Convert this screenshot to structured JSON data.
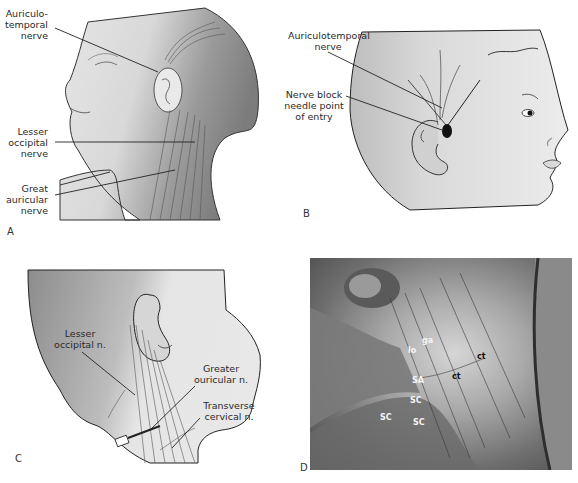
{
  "figure": {
    "panels": [
      {
        "id": "A",
        "letter": "A",
        "labels": {
          "auriculotemporal": [
            "Auriculo-",
            "temporal",
            "nerve"
          ],
          "lesser_occipital": [
            "Lesser",
            "occipital",
            "nerve"
          ],
          "great_auricular": [
            "Great",
            "auricular",
            "nerve"
          ]
        }
      },
      {
        "id": "B",
        "letter": "B",
        "labels": {
          "auriculotemporal": [
            "Auriculotemporal",
            "nerve"
          ],
          "needle_point": [
            "Nerve block",
            "needle point",
            "of entry"
          ]
        }
      },
      {
        "id": "C",
        "letter": "C",
        "labels": {
          "lesser_occipital": [
            "Lesser",
            "occipital n."
          ],
          "greater_auricular": [
            "Greater",
            "ouricular n."
          ],
          "transverse_cervical": [
            "Transverse",
            "cervical n."
          ]
        }
      },
      {
        "id": "D",
        "letter": "D",
        "labels": {
          "lo": "lo",
          "ga": "ga",
          "ct1": "ct",
          "ct2": "ct",
          "sa": "SA",
          "sc1": "SC",
          "sc2": "SC",
          "sc3": "SC"
        }
      }
    ]
  }
}
